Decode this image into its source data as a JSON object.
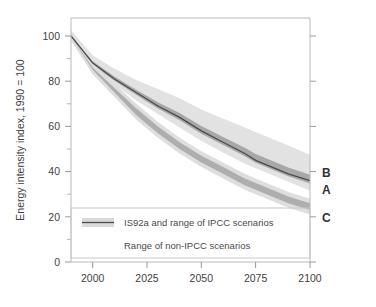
{
  "figure": {
    "title": "",
    "background_color": "#ffffff"
  },
  "axes": {
    "y_axis_title": "Energy intensity index, 1990 = 100",
    "y_ticks": [
      "0",
      "20",
      "40",
      "60",
      "80",
      "100"
    ],
    "x_ticks": [
      "2000",
      "2025",
      "2050",
      "2075",
      "2100"
    ]
  },
  "legend": {
    "entry_ipcc": "IS92a and range of IPCC scenarios",
    "entry_nonipcc": "Range of non-IPCC scenarios"
  },
  "end_labels": {
    "b": "B",
    "a": "A",
    "c": "C"
  },
  "colors": {
    "is92a_line": "#4d4d4d",
    "ipcc_band": "#d9d9d9",
    "ipcc_inner_band": "#a8a8a8",
    "nonipcc_band": "#b0b0b0",
    "nonipcc_band_light": "#d2d2d2",
    "frame": "#b9b9b9",
    "text": "#3f3f3f"
  },
  "chart_data": {
    "type": "line",
    "title": "",
    "xlabel": "",
    "ylabel": "Energy intensity index, 1990 = 100",
    "xlim": [
      1990,
      2100
    ],
    "ylim": [
      0,
      100
    ],
    "xticks": [
      2000,
      2025,
      2050,
      2075,
      2100
    ],
    "yticks": [
      0,
      20,
      40,
      60,
      80,
      100
    ],
    "grid": false,
    "legend_position": "inside-lower-left",
    "x": [
      1990,
      2000,
      2010,
      2020,
      2025,
      2030,
      2040,
      2050,
      2060,
      2070,
      2075,
      2080,
      2090,
      2100
    ],
    "series": [
      {
        "name": "IS92a",
        "type": "line",
        "label": "A",
        "values": [
          100,
          88,
          81,
          75,
          72,
          69,
          64,
          58,
          53,
          48,
          45,
          43,
          39,
          36
        ]
      },
      {
        "name": "IPCC scenarios range - upper",
        "type": "band_upper",
        "label": "B",
        "values": [
          100,
          89,
          83,
          78,
          76,
          74,
          70,
          65,
          61,
          57,
          55,
          53,
          49,
          45
        ]
      },
      {
        "name": "IPCC scenarios range - lower",
        "type": "band_lower",
        "values": [
          100,
          87,
          80,
          73,
          70,
          67,
          61,
          55,
          50,
          45,
          43,
          41,
          37,
          33
        ]
      },
      {
        "name": "Non-IPCC scenarios range - upper",
        "type": "band_upper",
        "values": [
          100,
          86,
          77,
          68,
          64,
          60,
          53,
          47,
          42,
          37,
          35,
          33,
          29,
          26
        ]
      },
      {
        "name": "Non-IPCC scenarios range - lower",
        "type": "band_lower",
        "label": "C",
        "values": [
          100,
          85,
          75,
          65,
          61,
          57,
          50,
          44,
          39,
          34,
          32,
          30,
          26,
          23
        ]
      }
    ],
    "annotations": [
      {
        "text": "B",
        "x": 2100,
        "y": 42,
        "note": "upper bound of IPCC range at 2100"
      },
      {
        "text": "A",
        "x": 2100,
        "y": 36,
        "note": "IS92a line at 2100"
      },
      {
        "text": "C",
        "x": 2100,
        "y": 24,
        "note": "non-IPCC range at 2100"
      }
    ]
  }
}
